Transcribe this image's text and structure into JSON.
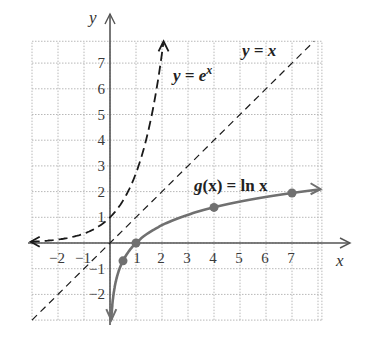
{
  "chart_data": {
    "type": "line",
    "title": "",
    "xlabel": "x",
    "ylabel": "y",
    "xlim": [
      -3,
      8.15
    ],
    "ylim": [
      -3,
      7.85
    ],
    "grid": true,
    "x_ticks": [
      -2,
      -1,
      1,
      2,
      3,
      4,
      5,
      6,
      7
    ],
    "y_ticks": [
      -2,
      -1,
      1,
      2,
      3,
      4,
      5,
      6,
      7
    ],
    "x_tick_labels": [
      "−2",
      "−1",
      "1",
      "2",
      "3",
      "4",
      "5",
      "6",
      "7"
    ],
    "y_tick_labels": [
      "−2",
      "−1",
      "1",
      "2",
      "3",
      "4",
      "5",
      "6",
      "7"
    ],
    "series": [
      {
        "name": "y = e^x",
        "style": "dashed",
        "color": "#1a1a1a",
        "x": [
          -3.1,
          -2,
          -1,
          0,
          0.5,
          1,
          1.5,
          2.05
        ],
        "y": [
          0.045,
          0.135,
          0.368,
          1,
          1.649,
          2.718,
          4.482,
          7.77
        ],
        "arrows": [
          "left",
          "up"
        ]
      },
      {
        "name": "y = x",
        "style": "dashed",
        "color": "#1a1a1a",
        "x": [
          -3,
          7.85
        ],
        "y": [
          -3,
          7.85
        ]
      },
      {
        "name": "g(x) = ln x",
        "style": "solid",
        "color": "#707070",
        "x": [
          0.05,
          0.1,
          0.2,
          0.35,
          0.5,
          0.75,
          1,
          1.5,
          2,
          3,
          4,
          5,
          6,
          7,
          8.1
        ],
        "y": [
          -3.0,
          -2.303,
          -1.609,
          -1.05,
          -0.693,
          -0.288,
          0,
          0.405,
          0.693,
          1.099,
          1.386,
          1.609,
          1.792,
          1.946,
          2.092
        ],
        "marked_points": [
          {
            "x": 0.5,
            "y": -0.693
          },
          {
            "x": 1,
            "y": 0
          },
          {
            "x": 4,
            "y": 1.386
          },
          {
            "x": 7,
            "y": 1.946
          }
        ],
        "arrows": [
          "down",
          "right"
        ]
      }
    ],
    "annotations": [
      {
        "text": "y = e^x",
        "x": 2.45,
        "y": 6.4
      },
      {
        "text": "y = x",
        "x": 5.15,
        "y": 7.35
      },
      {
        "text": "g(x) = ln x",
        "x": 3.2,
        "y": 2.2
      }
    ]
  },
  "labels": {
    "x_axis": "x",
    "y_axis": "y",
    "exp_eq_prefix": "y = ",
    "exp_eq_base": "e",
    "exp_eq_sup": "x",
    "identity_eq": "y = x",
    "ln_eq_g": "g",
    "ln_eq_rest": "(x) = ln x"
  },
  "colors": {
    "grid": "#b8b8b8",
    "axis": "#555555",
    "ln_curve": "#707070",
    "dashed": "#1a1a1a"
  }
}
